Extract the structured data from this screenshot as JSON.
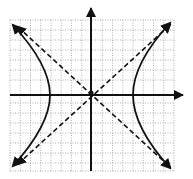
{
  "figure": {
    "type": "hyperbola-graph",
    "grid": {
      "x_min": 10,
      "x_max": 174,
      "y_min": 20,
      "y_max": 171,
      "step": 10.25,
      "color": "#9a9a9a"
    },
    "axes": {
      "origin_x": 91,
      "origin_y": 93,
      "color": "#111111"
    },
    "hyperbola": {
      "orientation": "horizontal",
      "center": [
        0,
        0
      ],
      "vertex_left_px": 50,
      "vertex_right_px": 133
    },
    "asymptotes": [
      {
        "name": "positive-slope",
        "from": [
          12,
          170
        ],
        "to": [
          173,
          22
        ]
      },
      {
        "name": "negative-slope",
        "from": [
          12,
          22
        ],
        "to": [
          173,
          170
        ]
      }
    ]
  }
}
